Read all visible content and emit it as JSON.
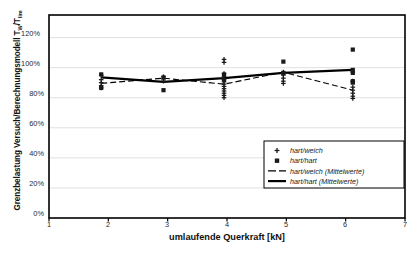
{
  "chart_data": {
    "type": "scatter",
    "title": "",
    "xlabel": "umlaufende Querkraft [kN]",
    "ylabel_text": "Grenzbelastung Versuch/Berechnungsmodell T",
    "ylabel_sub1": "W",
    "ylabel_mid": "/T",
    "ylabel_sub2": "lim",
    "xlim": [
      1,
      7
    ],
    "ylim": [
      0,
      135
    ],
    "xticks": [
      1,
      2,
      3,
      4,
      5,
      6,
      7
    ],
    "xticklabels": [
      "1",
      "2",
      "3",
      "4",
      "5",
      "6",
      "7"
    ],
    "yticks": [
      0,
      20,
      40,
      60,
      80,
      100,
      120
    ],
    "yticklabels": [
      "0%",
      "20%",
      "40%",
      "60%",
      "80%",
      "100%",
      "120%"
    ],
    "grid": "horizontal",
    "legend_position": "lower-right",
    "series": [
      {
        "name": "hart/weich",
        "marker": "plus",
        "type": "scatter",
        "points": [
          [
            1.88,
            95.0
          ],
          [
            1.88,
            92.0
          ],
          [
            1.88,
            90.0
          ],
          [
            1.88,
            88.0
          ],
          [
            1.88,
            86.5
          ],
          [
            2.93,
            94.0
          ],
          [
            2.93,
            92.5
          ],
          [
            2.93,
            91.0
          ],
          [
            3.95,
            105.5
          ],
          [
            3.95,
            103.5
          ],
          [
            3.95,
            96.0
          ],
          [
            3.95,
            94.0
          ],
          [
            3.95,
            92.0
          ],
          [
            3.95,
            90.5
          ],
          [
            3.95,
            89.0
          ],
          [
            3.95,
            87.5
          ],
          [
            3.95,
            86.0
          ],
          [
            3.95,
            84.5
          ],
          [
            3.95,
            83.0
          ],
          [
            3.95,
            81.5
          ],
          [
            3.95,
            80.0
          ],
          [
            4.95,
            97.0
          ],
          [
            4.95,
            95.0
          ],
          [
            4.95,
            93.0
          ],
          [
            4.95,
            91.0
          ],
          [
            4.95,
            89.5
          ],
          [
            6.12,
            97.0
          ],
          [
            6.12,
            91.0
          ],
          [
            6.12,
            87.0
          ],
          [
            6.12,
            85.0
          ],
          [
            6.12,
            83.0
          ],
          [
            6.12,
            81.0
          ],
          [
            6.12,
            79.5
          ]
        ]
      },
      {
        "name": "hart/hart",
        "marker": "square",
        "type": "scatter",
        "points": [
          [
            1.88,
            95.5
          ],
          [
            1.88,
            86.5
          ],
          [
            2.93,
            93.5
          ],
          [
            2.93,
            85.0
          ],
          [
            3.95,
            95.5
          ],
          [
            3.95,
            92.0
          ],
          [
            4.95,
            104.0
          ],
          [
            4.95,
            96.5
          ],
          [
            6.12,
            112.0
          ],
          [
            6.12,
            98.5
          ],
          [
            6.12,
            96.5
          ],
          [
            6.12,
            91.0
          ],
          [
            6.12,
            90.0
          ]
        ]
      },
      {
        "name": "hart/weich (Mittelwerte)",
        "type": "line",
        "style": "dashed",
        "x": [
          1.88,
          2.93,
          3.95,
          4.95,
          6.12
        ],
        "values": [
          89.5,
          93.0,
          89.0,
          97.0,
          85.0
        ]
      },
      {
        "name": "hart/hart (Mittelwerte)",
        "type": "line",
        "style": "solid",
        "x": [
          1.88,
          2.93,
          3.95,
          4.95,
          6.12
        ],
        "values": [
          93.5,
          90.5,
          93.0,
          96.5,
          98.5
        ]
      }
    ],
    "legend": [
      {
        "label": "hart/weich",
        "marker": "plus"
      },
      {
        "label": "hart/hart",
        "marker": "square"
      },
      {
        "label": "hart/weich (Mittelwerte)",
        "marker": "dashed-line"
      },
      {
        "label": "hart/hart (Mittelwerte)",
        "marker": "solid-line"
      }
    ],
    "colors": {
      "marker": "#1a1a1a",
      "line": "#000000",
      "grid": "#d9d9d9",
      "frame": "#000000",
      "text": "#1a1a1a"
    }
  }
}
